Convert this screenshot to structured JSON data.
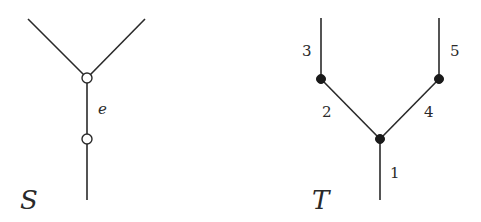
{
  "diagram": {
    "tree_S": {
      "name_label": "S",
      "edge_label": "e",
      "vertices": [
        {
          "id": "s_top",
          "type": "hollow",
          "x": 87,
          "y": 78
        },
        {
          "id": "s_mid",
          "type": "hollow",
          "x": 87,
          "y": 139
        }
      ],
      "edges": [
        {
          "from": [
            28,
            19
          ],
          "to": [
            87,
            78
          ]
        },
        {
          "from": [
            145,
            19
          ],
          "to": [
            87,
            78
          ]
        },
        {
          "from": [
            87,
            78
          ],
          "to": [
            87,
            139
          ],
          "label": "e"
        },
        {
          "from": [
            87,
            139
          ],
          "to": [
            87,
            200
          ]
        }
      ]
    },
    "tree_T": {
      "name_label": "T",
      "vertices": [
        {
          "id": "t_left",
          "type": "filled",
          "x": 321,
          "y": 79
        },
        {
          "id": "t_right",
          "type": "filled",
          "x": 439,
          "y": 79
        },
        {
          "id": "t_root",
          "type": "filled",
          "x": 380,
          "y": 139
        }
      ],
      "edge_labels": {
        "e1": "1",
        "e2": "2",
        "e3": "3",
        "e4": "4",
        "e5": "5"
      }
    }
  }
}
